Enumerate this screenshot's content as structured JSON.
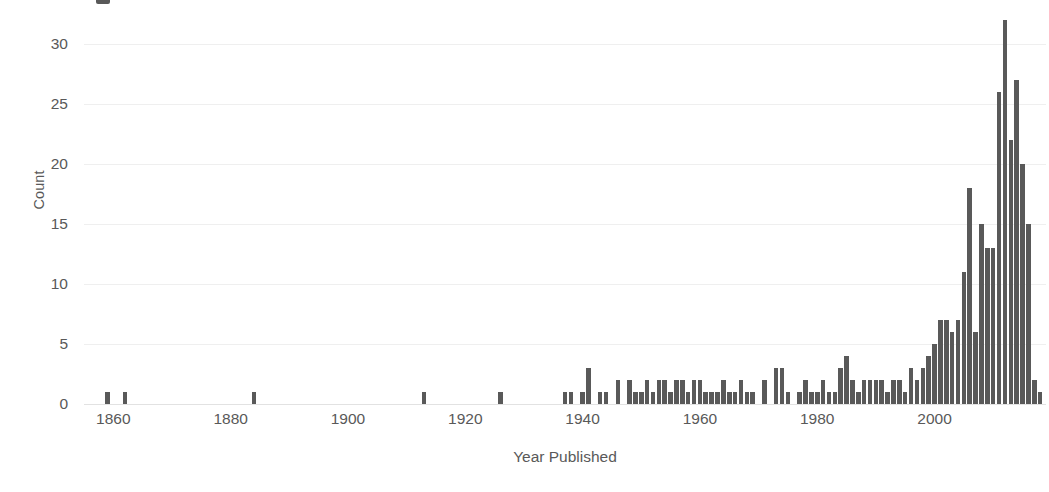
{
  "chart_data": {
    "type": "bar",
    "title": "",
    "xlabel": "Year Published",
    "ylabel": "Count",
    "xlim": [
      1855,
      2019
    ],
    "ylim": [
      0,
      32
    ],
    "y_ticks": [
      30,
      25,
      20,
      15,
      10,
      5,
      0
    ],
    "x_ticks": [
      1860,
      1880,
      1900,
      1920,
      1940,
      1960,
      1980,
      2000
    ],
    "grid": "horizontal",
    "legend": "none",
    "bar_color": "#595959",
    "grid_color": "#efefef",
    "text_color": "#595959",
    "categories": [
      1859,
      1862,
      1884,
      1913,
      1926,
      1937,
      1938,
      1940,
      1941,
      1943,
      1944,
      1946,
      1948,
      1949,
      1950,
      1951,
      1952,
      1953,
      1954,
      1955,
      1956,
      1957,
      1958,
      1959,
      1960,
      1961,
      1962,
      1963,
      1964,
      1965,
      1966,
      1967,
      1968,
      1969,
      1971,
      1973,
      1974,
      1975,
      1977,
      1978,
      1979,
      1980,
      1981,
      1982,
      1983,
      1984,
      1985,
      1986,
      1987,
      1988,
      1989,
      1990,
      1991,
      1992,
      1993,
      1994,
      1995,
      1996,
      1997,
      1998,
      1999,
      2000,
      2001,
      2002,
      2003,
      2004,
      2005,
      2006,
      2007,
      2008,
      2009,
      2010,
      2011,
      2012,
      2013,
      2014,
      2015,
      2016,
      2017,
      2018
    ],
    "values": [
      1,
      1,
      1,
      1,
      1,
      1,
      1,
      1,
      3,
      1,
      1,
      2,
      2,
      1,
      1,
      2,
      1,
      2,
      2,
      1,
      2,
      2,
      1,
      2,
      2,
      1,
      1,
      1,
      2,
      1,
      1,
      2,
      1,
      1,
      2,
      3,
      3,
      1,
      1,
      2,
      1,
      1,
      2,
      1,
      1,
      3,
      4,
      2,
      1,
      2,
      2,
      2,
      2,
      1,
      2,
      2,
      1,
      3,
      2,
      3,
      4,
      5,
      7,
      7,
      6,
      7,
      11,
      18,
      6,
      15,
      13,
      13,
      26,
      32,
      22,
      27,
      20,
      15,
      2,
      1
    ],
    "notes": {
      "max_value": 32,
      "max_year": 2014,
      "shape": "long sparse tail from 1859 rising steeply after 2000"
    }
  },
  "axes": {
    "y_title": "Count",
    "x_title": "Year Published",
    "y_tick_labels": [
      "30",
      "25",
      "20",
      "15",
      "10",
      "5",
      "0"
    ],
    "x_tick_labels": [
      "1860",
      "1880",
      "1900",
      "1920",
      "1940",
      "1960",
      "1980",
      "2000"
    ]
  }
}
